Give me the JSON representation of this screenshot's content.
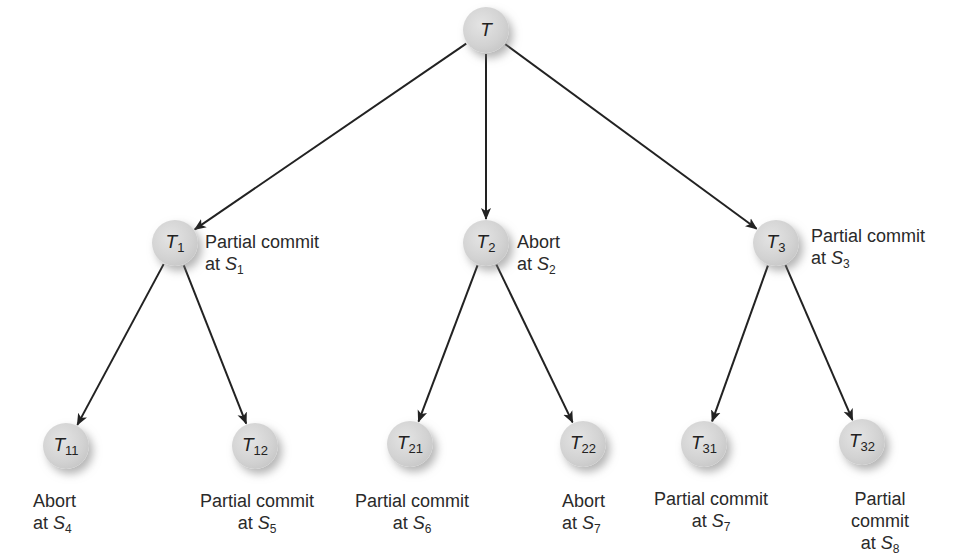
{
  "diagram": {
    "type": "tree",
    "nodes": [
      {
        "id": "T",
        "base": "T",
        "sub": "",
        "x": 486,
        "y": 30,
        "status": "",
        "site": ""
      },
      {
        "id": "T1",
        "base": "T",
        "sub": "1",
        "x": 175,
        "y": 243,
        "status": "Partial commit",
        "site_base": "S",
        "site_sub": "1"
      },
      {
        "id": "T2",
        "base": "T",
        "sub": "2",
        "x": 486,
        "y": 243,
        "status": "Abort",
        "site_base": "S",
        "site_sub": "2"
      },
      {
        "id": "T3",
        "base": "T",
        "sub": "3",
        "x": 776,
        "y": 243,
        "status": "Partial commit",
        "site_base": "S",
        "site_sub": "3"
      },
      {
        "id": "T11",
        "base": "T",
        "sub": "11",
        "x": 66,
        "y": 446,
        "status": "Abort",
        "site_base": "S",
        "site_sub": "4"
      },
      {
        "id": "T12",
        "base": "T",
        "sub": "12",
        "x": 255,
        "y": 446,
        "status": "Partial commit",
        "site_base": "S",
        "site_sub": "5"
      },
      {
        "id": "T21",
        "base": "T",
        "sub": "21",
        "x": 410,
        "y": 444,
        "status": "Partial commit",
        "site_base": "S",
        "site_sub": "6"
      },
      {
        "id": "T22",
        "base": "T",
        "sub": "22",
        "x": 583,
        "y": 444,
        "status": "Abort",
        "site_base": "S",
        "site_sub": "7"
      },
      {
        "id": "T31",
        "base": "T",
        "sub": "31",
        "x": 704,
        "y": 444,
        "status": "Partial commit",
        "site_base": "S",
        "site_sub": "7"
      },
      {
        "id": "T32",
        "base": "T",
        "sub": "32",
        "x": 862,
        "y": 442,
        "status": "Partial commit",
        "site_base": "S",
        "site_sub": "8"
      }
    ],
    "edges": [
      [
        "T",
        "T1"
      ],
      [
        "T",
        "T2"
      ],
      [
        "T",
        "T3"
      ],
      [
        "T1",
        "T11"
      ],
      [
        "T1",
        "T12"
      ],
      [
        "T2",
        "T21"
      ],
      [
        "T2",
        "T22"
      ],
      [
        "T3",
        "T31"
      ],
      [
        "T3",
        "T32"
      ]
    ],
    "annotations": {
      "at_word": "at"
    },
    "colors": {
      "edge": "#222222",
      "node_fill": "#d4d4d4",
      "text": "#2a2a2a"
    }
  }
}
